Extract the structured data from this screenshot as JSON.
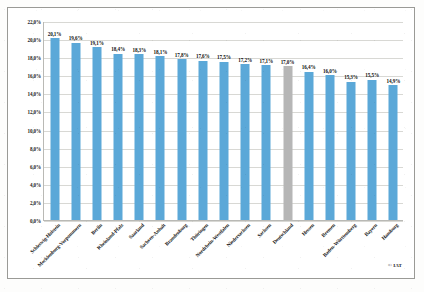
{
  "credit": "© IAT",
  "chart_data": {
    "type": "bar",
    "title": "",
    "subtitle": "",
    "xlabel": "",
    "ylabel": "",
    "ylim": [
      0,
      22
    ],
    "grid": true,
    "legend_position": "none",
    "value_suffix": "%",
    "decimal_separator": ",",
    "ytick_labels": [
      "22,0%",
      "20,0%",
      "18,0%",
      "16,0%",
      "14,0%",
      "12,0%",
      "10,0%",
      "8,0%",
      "6,0%",
      "4,0%",
      "2,0%",
      "0,0%"
    ],
    "ytick_values": [
      22,
      20,
      18,
      16,
      14,
      12,
      10,
      8,
      6,
      4,
      2,
      0
    ],
    "categories": [
      "Schleswig-Holstein",
      "Mecklenburg-Vorpommern",
      "Berlin",
      "Rheinland-Pfalz",
      "Saarland",
      "Sachsen-Anhalt",
      "Brandenburg",
      "Thüringen",
      "Nordrhein-Westfalen",
      "Niedersachsen",
      "Sachsen",
      "Deutschland",
      "Hessen",
      "Bremen",
      "Baden-Württemberg",
      "Bayern",
      "Hamburg"
    ],
    "values": [
      20.1,
      19.6,
      19.1,
      18.4,
      18.3,
      18.1,
      17.8,
      17.6,
      17.5,
      17.2,
      17.1,
      17.0,
      16.4,
      16.0,
      15.3,
      15.5,
      14.9
    ],
    "value_labels": [
      "20,1%",
      "19,6%",
      "19,1%",
      "18,4%",
      "18,3%",
      "18,1%",
      "17,8%",
      "17,6%",
      "17,5%",
      "17,2%",
      "17,1%",
      "17,0%",
      "16,4%",
      "16,0%",
      "15,3%",
      "15,5%",
      "14,9%"
    ],
    "highlight_index": 11,
    "colors": {
      "bar": "#5ba8d8",
      "bar_highlight": "#b6b6b6",
      "grid": "#d8d8d4",
      "axis": "#b9b9b5",
      "text": "#111111",
      "frame": "#9a9a96",
      "background": "#ffffff"
    }
  }
}
